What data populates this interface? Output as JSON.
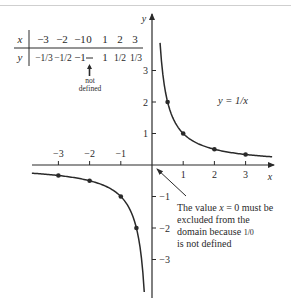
{
  "figure": {
    "function_label": "y = 1/x",
    "x_axis_label": "x",
    "y_axis_label": "y",
    "annotation": {
      "lines": [
        "The value x = 0 must be",
        "excluded from the",
        "domain because 1/0",
        "is not defined"
      ]
    },
    "table": {
      "row_labels": [
        "x",
        "y"
      ],
      "x_values": [
        "−3",
        "−2",
        "−1",
        "0",
        "1",
        "2",
        "3"
      ],
      "y_values": [
        "−1/3",
        "−1/2",
        "−1",
        "—",
        "1",
        "1/2",
        "1/3"
      ],
      "note": [
        "not",
        "defined"
      ]
    }
  },
  "chart_data": {
    "type": "line",
    "title": "",
    "function": "y = 1/x",
    "xlabel": "x",
    "ylabel": "y",
    "xlim": [
      -3.85,
      3.85
    ],
    "ylim": [
      -4,
      4.8
    ],
    "x_ticks": [
      -3,
      -2,
      -1,
      1,
      2,
      3
    ],
    "y_ticks": [
      -3,
      -2,
      -1,
      1,
      2,
      3
    ],
    "grid": false,
    "series": [
      {
        "name": "y = 1/x (x > 0)",
        "x": [
          0.5,
          1,
          2,
          3
        ],
        "y": [
          2,
          1,
          0.5,
          0.3333
        ]
      },
      {
        "name": "y = 1/x (x < 0)",
        "x": [
          -3,
          -2,
          -1,
          -0.5
        ],
        "y": [
          -0.3333,
          -0.5,
          -1,
          -2
        ]
      }
    ],
    "table": {
      "x": [
        -3,
        -2,
        -1,
        0,
        1,
        2,
        3
      ],
      "y": [
        "-1/3",
        "-1/2",
        "-1",
        "not defined",
        "1",
        "1/2",
        "1/3"
      ]
    },
    "annotations": [
      "not defined (below x = 0 in table)",
      "The value x = 0 must be excluded from the domain because 1/0 is not defined"
    ]
  }
}
